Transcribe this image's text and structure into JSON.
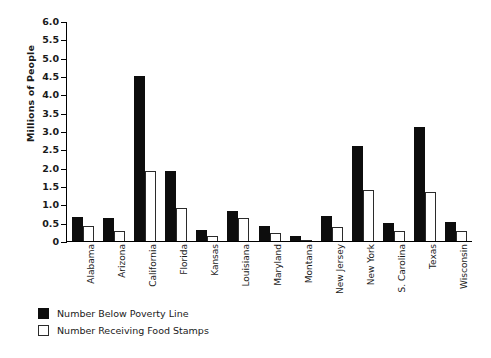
{
  "chart_data": {
    "type": "bar",
    "title": "",
    "xlabel": "",
    "ylabel": "Millions of People",
    "ylim": [
      0,
      6.0
    ],
    "ytick_step": 0.5,
    "yticks": [
      "6.0",
      "5.5",
      "5.0",
      "4.5",
      "4.0",
      "3.5",
      "3.0",
      "2.5",
      "2.0",
      "1.5",
      "1.0",
      "0.5",
      "0"
    ],
    "grid": false,
    "legend_position": "bottom-left",
    "categories": [
      "Alabama",
      "Arizona",
      "California",
      "Florida",
      "Kansas",
      "Louisiana",
      "Maryland",
      "Montana",
      "New Jersey",
      "New York",
      "S. Carolina",
      "Texas",
      "Wisconsin"
    ],
    "series": [
      {
        "name": "Number Below Poverty Line",
        "color": "#0d0d0d",
        "style": "filled",
        "values": [
          0.65,
          0.63,
          4.5,
          1.9,
          0.3,
          0.82,
          0.41,
          0.15,
          0.68,
          2.6,
          0.48,
          3.1,
          0.52
        ]
      },
      {
        "name": "Number Receiving Food Stamps",
        "color": "#ffffff",
        "style": "outlined",
        "values": [
          0.4,
          0.27,
          1.9,
          0.9,
          0.13,
          0.62,
          0.22,
          0.03,
          0.38,
          1.4,
          0.28,
          1.35,
          0.28
        ]
      }
    ]
  },
  "legend": {
    "items": [
      {
        "label": "Number Below Poverty Line",
        "style": "dark"
      },
      {
        "label": "Number Receiving Food Stamps",
        "style": "light"
      }
    ]
  }
}
